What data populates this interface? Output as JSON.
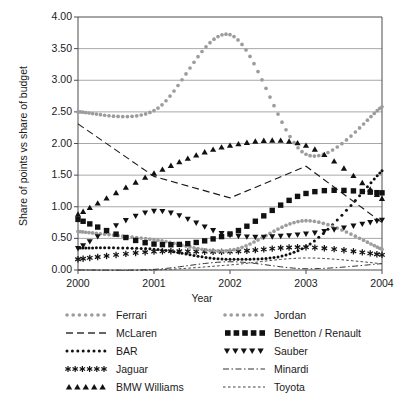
{
  "chart_data": {
    "type": "line",
    "title": "",
    "xlabel": "Year",
    "ylabel": "Share of points vs share of budget",
    "x": [
      2000,
      2001,
      2002,
      2003,
      2004
    ],
    "xlim": [
      2000,
      2004
    ],
    "ylim": [
      0.0,
      4.0
    ],
    "ytick_labels": [
      "0.00",
      "0.50",
      "1.00",
      "1.50",
      "2.00",
      "2.50",
      "3.00",
      "3.50",
      "4.00"
    ],
    "ytick_values": [
      0.0,
      0.5,
      1.0,
      1.5,
      2.0,
      2.5,
      3.0,
      3.5,
      4.0
    ],
    "xtick_labels": [
      "2000",
      "2001",
      "2002",
      "2003",
      "2004"
    ],
    "grid": "horizontal",
    "legend_position": "below-plot",
    "legend_columns": 2,
    "series": [
      {
        "name": "Ferrari",
        "style": "dotted-round-marker",
        "color": "#9c9c9c",
        "values": [
          2.5,
          2.52,
          3.72,
          1.83,
          2.58
        ]
      },
      {
        "name": "McLaren",
        "style": "dashed",
        "color": "#1a1a1a",
        "values": [
          2.31,
          1.48,
          1.14,
          1.64,
          0.75
        ]
      },
      {
        "name": "BAR",
        "style": "dotted-small",
        "color": "#111111",
        "values": [
          0.35,
          0.33,
          0.17,
          0.37,
          1.57
        ]
      },
      {
        "name": "Jaguar",
        "style": "asterisk",
        "color": "#111111",
        "values": [
          0.17,
          0.29,
          0.29,
          0.36,
          0.24
        ]
      },
      {
        "name": "BMW Williams",
        "style": "triangle-up",
        "color": "#111111",
        "values": [
          0.88,
          1.53,
          1.97,
          1.97,
          1.13
        ]
      },
      {
        "name": "Jordan",
        "style": "dotted-round-marker",
        "color": "#9c9c9c",
        "values": [
          0.61,
          0.48,
          0.31,
          0.78,
          0.33
        ]
      },
      {
        "name": "Benetton / Renault",
        "style": "square",
        "color": "#111111",
        "values": [
          0.8,
          0.41,
          0.57,
          1.21,
          1.22
        ]
      },
      {
        "name": "Sauber",
        "style": "triangle-down",
        "color": "#111111",
        "values": [
          0.34,
          0.93,
          0.55,
          0.57,
          0.79
        ]
      },
      {
        "name": "Minardi",
        "style": "dash-dot",
        "color": "#333333",
        "values": [
          0.0,
          0.01,
          0.13,
          0.02,
          0.1
        ]
      },
      {
        "name": "Toyota",
        "style": "fine-dotted",
        "color": "#444444",
        "values": [
          0.0,
          0.0,
          0.08,
          0.19,
          0.1
        ]
      }
    ]
  },
  "legend": {
    "entries": [
      {
        "label": "Ferrari",
        "swatch": "dotted-round-marker-gray"
      },
      {
        "label": "Jordan",
        "swatch": "dotted-round-marker-gray"
      },
      {
        "label": "McLaren",
        "swatch": "dashed-black"
      },
      {
        "label": "Benetton / Renault",
        "swatch": "square-black"
      },
      {
        "label": "BAR",
        "swatch": "dotted-small-black"
      },
      {
        "label": "Sauber",
        "swatch": "triangle-down-black"
      },
      {
        "label": "Jaguar",
        "swatch": "asterisk-black"
      },
      {
        "label": "Minardi",
        "swatch": "dash-dot-black"
      },
      {
        "label": "BMW Williams",
        "swatch": "triangle-up-black"
      },
      {
        "label": "Toyota",
        "swatch": "fine-dotted-black"
      }
    ]
  },
  "colors": {
    "gray_series": "#9c9c9c",
    "black_series": "#111111",
    "grid": "#a8a8a8",
    "axis": "#4d4d4d",
    "text": "#1a1a1a"
  }
}
